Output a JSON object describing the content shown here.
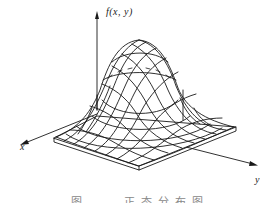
{
  "figure": {
    "type": "3d-wireframe-surface",
    "axes": {
      "vertical_label": "f(x, y)",
      "x_label": "x",
      "y_label": "y"
    },
    "caption": "图 — 正态分布图",
    "colors": {
      "line": "#1a1a1a",
      "background": "#ffffff",
      "caption": "#888888"
    }
  }
}
